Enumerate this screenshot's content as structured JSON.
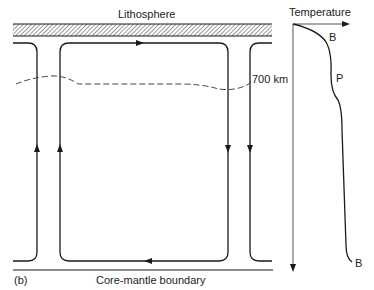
{
  "figure": {
    "panel_label": "(b)",
    "top_label": "Lithosphere",
    "bottom_label": "Core-mantle boundary",
    "depth_marker": "700 km",
    "temperature_axis_label": "Temperature",
    "curve_labels": {
      "upper_boundary_layer": "B",
      "plateau": "P",
      "lower_boundary_layer": "B"
    }
  },
  "colors": {
    "line": "#1a1a1a",
    "hatch": "#555555",
    "dashed": "#444444",
    "background": "#ffffff"
  }
}
